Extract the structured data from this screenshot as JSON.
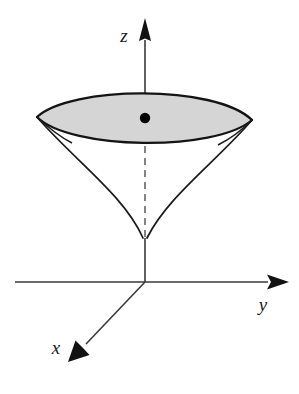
{
  "figure": {
    "title": "",
    "caption": "",
    "background_color": "#ffffff",
    "stroke_color": "#1a1a1a",
    "surface_fill_color": "#d5d5d5",
    "hidden_line_color": "#6e6e6e",
    "axes": [
      {
        "id": "z",
        "label": "z",
        "label_position": "left-of-arrow",
        "direction": "up",
        "label_x": 124,
        "label_y": 42
      },
      {
        "id": "y",
        "label": "y",
        "label_position": "below-arrow",
        "direction": "right",
        "label_x": 263,
        "label_y": 311
      },
      {
        "id": "x",
        "label": "x",
        "label_position": "left-of-arrow",
        "direction": "down-left",
        "label_x": 56,
        "label_y": 354
      }
    ],
    "origin": {
      "x": 145,
      "y": 282
    },
    "marker_point": {
      "name": "center-point",
      "x": 145,
      "y": 118,
      "radius": 5,
      "color": "#000000"
    },
    "surface": {
      "name": "cone-surface",
      "type": "cone",
      "apex": {
        "x": 145,
        "y": 238
      },
      "cap_center": {
        "x": 145,
        "y": 118
      },
      "cap_left_tip": {
        "x": 37,
        "y": 117
      },
      "cap_right_tip": {
        "x": 252,
        "y": 120
      },
      "cap_top_apex": {
        "x": 145,
        "y": 88
      },
      "cap_bottom_apex": {
        "x": 145,
        "y": 146
      },
      "filled": true
    },
    "hidden_axis_segment": {
      "name": "z-axis-hidden-segment",
      "from": {
        "x": 145,
        "y": 146
      },
      "to": {
        "x": 145,
        "y": 238
      },
      "style": "dashed"
    }
  }
}
